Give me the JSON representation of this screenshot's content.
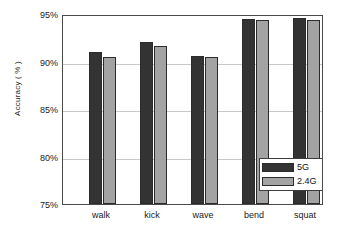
{
  "chart_data": {
    "type": "bar",
    "title": "",
    "xlabel": "",
    "ylabel": "Accuracy ( % )",
    "categories": [
      "walk",
      "kick",
      "wave",
      "bend",
      "squat"
    ],
    "ylim": [
      75,
      95
    ],
    "ytick_labels": [
      "75%",
      "80%",
      "85%",
      "90%",
      "95%"
    ],
    "ytick_values": [
      75,
      80,
      85,
      90,
      95
    ],
    "grid": true,
    "legend_position": "lower right",
    "series": [
      {
        "name": "5G",
        "color": "#333333",
        "values": [
          91.2,
          92.2,
          90.8,
          94.7,
          94.8
        ]
      },
      {
        "name": "2.4G",
        "color": "#a3a3a3",
        "values": [
          90.6,
          91.8,
          90.6,
          94.6,
          94.6
        ]
      }
    ]
  },
  "legend": {
    "entries": [
      {
        "label": "5G"
      },
      {
        "label": "2.4G"
      }
    ]
  },
  "artifacts": {
    "top_line": "",
    "second_line": ""
  }
}
